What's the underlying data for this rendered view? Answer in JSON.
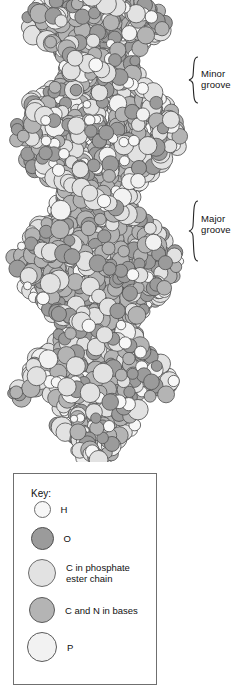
{
  "figure": {
    "type": "space-filling molecular model",
    "alt": "Space-filling model of the DNA double helix showing alternating minor and major grooves"
  },
  "annotations": [
    {
      "id": "minor-groove",
      "label": "Minor\ngroove",
      "brace_top": 56,
      "brace_height": 46
    },
    {
      "id": "major-groove",
      "label": "Major\ngroove",
      "brace_top": 200,
      "brace_height": 60
    }
  ],
  "key": {
    "title": "Key:",
    "items": [
      {
        "symbol": "H",
        "label": "H",
        "color": "#f7f7f7",
        "stroke": "#6d6d6d",
        "diameter": 17
      },
      {
        "symbol": "O",
        "label": "O",
        "color": "#9b9b9b",
        "stroke": "#4f4f4f",
        "diameter": 23
      },
      {
        "symbol": "C-phosphate",
        "label": "C in phosphate\nester chain",
        "color": "#e2e2e2",
        "stroke": "#6d6d6d",
        "diameter": 28
      },
      {
        "symbol": "C-N-bases",
        "label": "C and N in bases",
        "color": "#b4b4b4",
        "stroke": "#5a5a5a",
        "diameter": 26
      },
      {
        "symbol": "P",
        "label": "P",
        "color": "#f2f2f2",
        "stroke": "#5a5a5a",
        "diameter": 30
      }
    ],
    "row_tops": [
      27,
      53,
      85,
      123,
      158
    ]
  },
  "palette": {
    "H": "#f7f7f7",
    "O": "#9b9b9b",
    "C_phosphate": "#e2e2e2",
    "C_N_bases": "#b4b4b4",
    "P": "#f2f2f2",
    "outline": "#545454",
    "background": "#ffffff",
    "box_border": "#6f6f6f"
  },
  "helix": {
    "turns": 3.4,
    "axis_x": 97,
    "top": 0,
    "bottom": 455,
    "pitch": 132,
    "radius": 74,
    "waists": [
      100,
      232,
      364
    ],
    "bulges": [
      36,
      168,
      300,
      420
    ]
  }
}
